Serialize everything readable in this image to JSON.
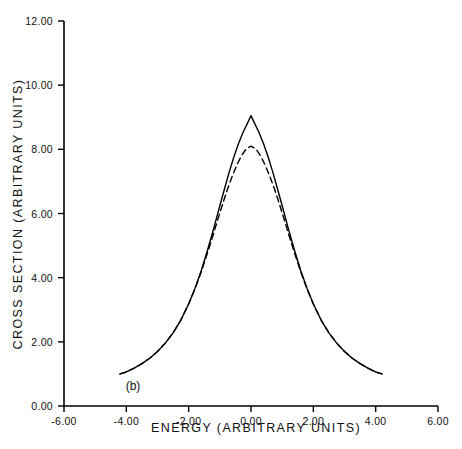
{
  "chart_data": {
    "type": "line",
    "title": "",
    "panel_label": "(b)",
    "xlabel": "ENERGY (ARBITRARY UNITS)",
    "ylabel": "CROSS SECTION (ARBITRARY UNITS)",
    "xlim": [
      -6.0,
      6.0
    ],
    "ylim": [
      0.0,
      12.0
    ],
    "xticks": [
      -6.0,
      -4.0,
      -2.0,
      0.0,
      2.0,
      4.0,
      6.0
    ],
    "yticks": [
      0.0,
      2.0,
      4.0,
      6.0,
      8.0,
      10.0,
      12.0
    ],
    "xtick_labels": [
      "-6.00",
      "-4.00",
      "-2.00",
      "0.00",
      "2.00",
      "4.00",
      "6.00"
    ],
    "ytick_labels": [
      "0.00",
      "2.00",
      "4.00",
      "6.00",
      "8.00",
      "10.00",
      "12.00"
    ],
    "grid": false,
    "legend": "none",
    "tick_direction": "out",
    "axis_color": "#000000",
    "series": [
      {
        "name": "solid-curve",
        "style": "solid",
        "color": "#000000",
        "x": [
          -4.2,
          -4.0,
          -3.75,
          -3.5,
          -3.25,
          -3.0,
          -2.75,
          -2.5,
          -2.25,
          -2.0,
          -1.8,
          -1.6,
          -1.4,
          -1.2,
          -1.0,
          -0.85,
          -0.7,
          -0.55,
          -0.4,
          -0.25,
          -0.1,
          0.0,
          0.1,
          0.25,
          0.4,
          0.55,
          0.7,
          0.85,
          1.0,
          1.2,
          1.4,
          1.6,
          1.8,
          2.0,
          2.25,
          2.5,
          2.75,
          3.0,
          3.25,
          3.5,
          3.75,
          4.0,
          4.2
        ],
        "y": [
          1.0,
          1.06,
          1.18,
          1.32,
          1.49,
          1.7,
          1.96,
          2.28,
          2.68,
          3.18,
          3.66,
          4.21,
          4.84,
          5.52,
          6.24,
          6.77,
          7.29,
          7.76,
          8.18,
          8.54,
          8.84,
          9.05,
          8.84,
          8.54,
          8.18,
          7.76,
          7.29,
          6.77,
          6.24,
          5.52,
          4.84,
          4.21,
          3.66,
          3.18,
          2.68,
          2.28,
          1.96,
          1.7,
          1.49,
          1.32,
          1.18,
          1.06,
          1.0
        ]
      },
      {
        "name": "dashed-curve",
        "style": "dashed",
        "color": "#000000",
        "x": [
          -4.2,
          -4.0,
          -3.75,
          -3.5,
          -3.25,
          -3.0,
          -2.75,
          -2.5,
          -2.25,
          -2.0,
          -1.8,
          -1.6,
          -1.4,
          -1.2,
          -1.05,
          -0.9,
          -0.75,
          -0.6,
          -0.45,
          -0.3,
          -0.15,
          0.0,
          0.15,
          0.3,
          0.45,
          0.6,
          0.75,
          0.9,
          1.05,
          1.2,
          1.4,
          1.6,
          1.8,
          2.0,
          2.25,
          2.5,
          2.75,
          3.0,
          3.25,
          3.5,
          3.75,
          4.0,
          4.2
        ],
        "y": [
          1.0,
          1.06,
          1.18,
          1.32,
          1.49,
          1.7,
          1.96,
          2.28,
          2.68,
          3.18,
          3.64,
          4.17,
          4.76,
          5.38,
          5.86,
          6.33,
          6.77,
          7.17,
          7.52,
          7.81,
          8.02,
          8.1,
          8.02,
          7.81,
          7.52,
          7.17,
          6.77,
          6.33,
          5.86,
          5.38,
          4.76,
          4.17,
          3.64,
          3.18,
          2.68,
          2.28,
          1.96,
          1.7,
          1.49,
          1.32,
          1.18,
          1.06,
          1.0
        ]
      }
    ],
    "peak_values": {
      "solid_peak": 9.05,
      "dashed_peak": 8.1,
      "tail_value": 1.0
    }
  }
}
